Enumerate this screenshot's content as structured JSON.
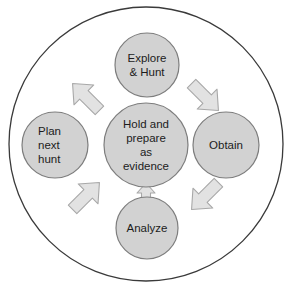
{
  "diagram": {
    "type": "cycle-diagram",
    "colors": {
      "page_background": "#ffffff",
      "outer_ring_stroke": "#3a3a3a",
      "outer_ring_fill": "#ffffff",
      "node_fill": "#d2d2d2",
      "node_stroke": "#7d7d7d",
      "arrow_fill": "#e2e2e2",
      "arrow_stroke": "#a8a8a8",
      "label_color": "#1c1c1c"
    },
    "outer_ring": {
      "name": "outer-boundary-circle",
      "cx": 146,
      "cy": 144,
      "r": 137
    },
    "center_node": {
      "id": "hold-and-prepare-as-evidence",
      "cx": 146,
      "cy": 145,
      "r": 42,
      "lines": [
        "Hold and",
        "prepare",
        "as",
        "evidence"
      ]
    },
    "nodes": [
      {
        "id": "explore-and-hunt",
        "position": "top",
        "cx": 147,
        "cy": 65,
        "r": 32,
        "lines": [
          "Explore",
          "& Hunt"
        ]
      },
      {
        "id": "obtain",
        "position": "right",
        "cx": 226,
        "cy": 145,
        "r": 33,
        "lines": [
          "Obtain"
        ]
      },
      {
        "id": "analyze",
        "position": "bottom",
        "cx": 147,
        "cy": 228,
        "r": 31,
        "lines": [
          "Analyze"
        ]
      },
      {
        "id": "plan-next-hunt",
        "position": "left",
        "cx": 55,
        "cy": 145,
        "r": 33,
        "lines": [
          "Plan",
          "next",
          "hunt"
        ]
      }
    ],
    "arrows": [
      {
        "id": "arrow-plan-to-explore",
        "from": "plan-next-hunt",
        "to": "explore-and-hunt",
        "direction": "up-right",
        "cx": 86,
        "cy": 97,
        "rotation": -45
      },
      {
        "id": "arrow-explore-to-obtain",
        "from": "explore-and-hunt",
        "to": "obtain",
        "direction": "down-right",
        "cx": 205,
        "cy": 97,
        "rotation": 45
      },
      {
        "id": "arrow-obtain-to-analyze",
        "from": "obtain",
        "to": "analyze",
        "direction": "down-left",
        "cx": 205,
        "cy": 196,
        "rotation": 135
      },
      {
        "id": "arrow-analyze-to-plan",
        "from": "analyze",
        "to": "plan-next-hunt",
        "direction": "up-left",
        "cx": 86,
        "cy": 196,
        "rotation": -135
      },
      {
        "id": "arrow-analyze-to-center",
        "from": "analyze",
        "to": "hold-and-prepare-as-evidence",
        "direction": "up",
        "cx": 146,
        "cy": 194,
        "rotation": 0
      }
    ]
  }
}
